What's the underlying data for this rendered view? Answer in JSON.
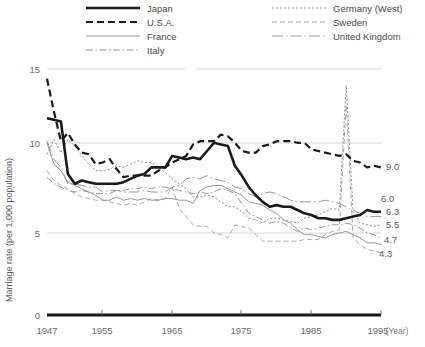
{
  "chart_data": {
    "type": "line",
    "title": "",
    "xlabel": "(Year)",
    "ylabel": "Marriage rate (per 1,000 population)",
    "xlim": [
      1947,
      1995
    ],
    "ylim": [
      0,
      15
    ],
    "yticks": [
      0,
      5,
      10,
      15
    ],
    "ytick_labels": [
      "0",
      "5",
      "10",
      "15"
    ],
    "xticks": [
      1947,
      1955,
      1965,
      1975,
      1985,
      1995
    ],
    "xtick_labels": [
      "1947",
      "1955",
      "1965",
      "1975",
      "1985",
      "1995"
    ],
    "grid": "horizontal",
    "legend_position": "top",
    "x": [
      1947,
      1948,
      1949,
      1950,
      1951,
      1952,
      1953,
      1954,
      1955,
      1956,
      1957,
      1958,
      1959,
      1960,
      1961,
      1962,
      1963,
      1964,
      1965,
      1966,
      1967,
      1968,
      1969,
      1970,
      1971,
      1972,
      1973,
      1974,
      1975,
      1976,
      1977,
      1978,
      1979,
      1980,
      1981,
      1982,
      1983,
      1984,
      1985,
      1986,
      1987,
      1988,
      1989,
      1990,
      1991,
      1992,
      1993,
      1994,
      1995
    ],
    "series": [
      {
        "name": "Japan",
        "style": "solid-thick",
        "color": "#1a1a1a",
        "end_label": "6.3",
        "values": [
          12.0,
          11.9,
          11.8,
          8.6,
          8.0,
          8.2,
          8.1,
          8.0,
          8.0,
          8.0,
          8.0,
          8.1,
          8.3,
          8.5,
          8.6,
          9.0,
          9.0,
          9.0,
          9.7,
          9.6,
          9.5,
          9.6,
          9.5,
          10.0,
          10.5,
          10.4,
          10.3,
          9.1,
          8.5,
          7.8,
          7.3,
          6.9,
          6.6,
          6.7,
          6.6,
          6.6,
          6.4,
          6.2,
          6.1,
          5.9,
          5.9,
          5.8,
          5.8,
          5.9,
          6.0,
          6.1,
          6.4,
          6.3,
          6.3
        ]
      },
      {
        "name": "U.S.A.",
        "style": "dashed",
        "color": "#1a1a1a",
        "end_label": "9.0",
        "values": [
          14.4,
          12.4,
          10.6,
          11.1,
          10.4,
          9.9,
          9.8,
          9.2,
          9.3,
          9.5,
          8.9,
          8.4,
          8.5,
          8.5,
          8.5,
          8.5,
          8.8,
          9.0,
          9.3,
          9.5,
          9.7,
          10.4,
          10.6,
          10.6,
          10.6,
          11.0,
          10.9,
          10.5,
          10.0,
          9.9,
          9.9,
          10.3,
          10.4,
          10.6,
          10.6,
          10.6,
          10.5,
          10.5,
          10.1,
          10.0,
          9.9,
          9.8,
          9.7,
          9.8,
          9.4,
          9.3,
          9.0,
          9.1,
          9.0
        ]
      },
      {
        "name": "France",
        "style": "solid-thin",
        "color": "#8c8c8c",
        "end_label": "4.3",
        "values": [
          10.5,
          9.2,
          8.8,
          8.1,
          7.9,
          7.7,
          7.5,
          7.3,
          7.0,
          7.0,
          7.2,
          7.0,
          7.1,
          7.0,
          7.1,
          7.0,
          7.0,
          7.1,
          7.1,
          7.0,
          7.0,
          6.8,
          7.6,
          7.8,
          7.9,
          7.9,
          7.7,
          7.5,
          7.3,
          6.9,
          6.8,
          6.7,
          6.4,
          6.2,
          5.8,
          5.6,
          5.2,
          4.9,
          4.9,
          4.8,
          4.7,
          4.9,
          5.0,
          5.1,
          4.9,
          4.7,
          4.4,
          4.4,
          4.3
        ]
      },
      {
        "name": "Italy",
        "style": "dash-dot",
        "color": "#8c8c8c",
        "end_label": "4.7",
        "values": [
          8.4,
          8.0,
          7.8,
          7.6,
          7.5,
          7.6,
          7.5,
          7.4,
          7.4,
          7.4,
          7.6,
          7.6,
          7.7,
          7.7,
          7.8,
          7.7,
          7.8,
          7.8,
          7.7,
          7.6,
          7.5,
          7.4,
          7.5,
          7.4,
          7.5,
          7.7,
          7.6,
          7.4,
          6.8,
          6.2,
          6.0,
          5.8,
          5.6,
          5.7,
          5.6,
          5.3,
          5.1,
          5.3,
          5.2,
          5.3,
          5.4,
          5.5,
          5.5,
          5.6,
          5.5,
          5.3,
          5.0,
          4.9,
          4.7
        ]
      },
      {
        "name": "Germany (West)",
        "style": "dotted",
        "color": "#8c8c8c",
        "end_label": "5.5",
        "values": [
          9.8,
          10.7,
          9.9,
          10.7,
          10.3,
          9.7,
          9.2,
          8.8,
          8.8,
          8.9,
          9.1,
          9.0,
          9.2,
          9.4,
          9.3,
          9.3,
          9.0,
          8.7,
          8.3,
          8.0,
          7.7,
          7.2,
          7.2,
          7.3,
          7.2,
          6.9,
          6.6,
          6.6,
          6.3,
          5.9,
          5.8,
          5.6,
          5.9,
          5.9,
          5.8,
          5.7,
          5.6,
          5.9,
          6.0,
          6.1,
          6.3,
          6.5,
          6.4,
          14.0,
          6.3,
          5.6,
          5.5,
          5.4,
          5.5
        ]
      },
      {
        "name": "Sweden",
        "style": "dashed-thin",
        "color": "#a0a0a0",
        "end_label": "",
        "values": [
          8.8,
          8.2,
          7.9,
          7.7,
          7.4,
          7.2,
          7.1,
          7.0,
          7.0,
          6.9,
          6.8,
          6.7,
          6.8,
          6.7,
          6.9,
          7.1,
          7.0,
          7.1,
          7.8,
          6.5,
          6.0,
          5.5,
          5.4,
          5.4,
          5.0,
          4.9,
          4.7,
          5.5,
          5.4,
          5.3,
          4.9,
          4.5,
          4.5,
          4.5,
          4.5,
          4.5,
          4.5,
          4.6,
          4.6,
          4.6,
          4.9,
          5.1,
          5.2,
          12.8,
          4.7,
          4.3,
          4.0,
          3.9,
          3.8
        ]
      },
      {
        "name": "United Kingdom",
        "style": "long-dash-dot",
        "color": "#8c8c8c",
        "end_label": "6.0",
        "values": [
          10.6,
          9.5,
          9.0,
          8.0,
          8.0,
          7.9,
          7.8,
          7.8,
          7.5,
          7.6,
          7.6,
          7.5,
          7.5,
          7.5,
          7.6,
          7.5,
          7.5,
          7.5,
          7.8,
          7.9,
          8.3,
          8.4,
          8.3,
          8.5,
          8.3,
          8.2,
          8.1,
          7.8,
          7.7,
          7.4,
          7.2,
          7.4,
          7.5,
          7.4,
          7.2,
          7.0,
          6.9,
          6.9,
          6.9,
          6.9,
          7.0,
          6.9,
          6.8,
          6.6,
          6.4,
          6.2,
          6.0,
          6.0,
          6.0
        ]
      }
    ]
  },
  "legend": {
    "items": [
      {
        "label": "Japan",
        "key": "japan"
      },
      {
        "label": "U.S.A.",
        "key": "usa"
      },
      {
        "label": "France",
        "key": "france"
      },
      {
        "label": "Italy",
        "key": "italy"
      },
      {
        "label": "Germany (West)",
        "key": "germany"
      },
      {
        "label": "Sweden",
        "key": "sweden"
      },
      {
        "label": "United Kingdom",
        "key": "uk"
      }
    ]
  },
  "axes": {
    "y_title": "Marriage rate (per 1,000 population)",
    "x_unit": "(Year)",
    "ytick_0": "0",
    "ytick_5": "5",
    "ytick_10": "10",
    "ytick_15": "15",
    "xtick_1947": "1947",
    "xtick_1955": "1955",
    "xtick_1965": "1965",
    "xtick_1975": "1975",
    "xtick_1985": "1985",
    "xtick_1995": "1995"
  },
  "end_labels": {
    "usa": "9.0",
    "uk": "6.0",
    "japan": "6.3",
    "germany": "5.5",
    "italy": "4.7",
    "france": "4.3"
  },
  "colors": {
    "japan": "#1a1a1a",
    "usa": "#1a1a1a",
    "grid": "#d6d6d6",
    "text": "#5a5a5a",
    "thin": "#8c8c8c"
  }
}
